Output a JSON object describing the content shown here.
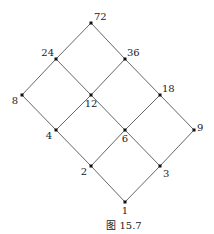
{
  "diagram": {
    "type": "hasse-diagram",
    "caption": "图 15.7",
    "nodes": [
      {
        "id": "72",
        "label": "72",
        "x": 91,
        "y": 23,
        "lx": 94,
        "ly": 20,
        "anchor": "start"
      },
      {
        "id": "24",
        "label": "24",
        "x": 56,
        "y": 59,
        "lx": 54,
        "ly": 56,
        "anchor": "end"
      },
      {
        "id": "36",
        "label": "36",
        "x": 125,
        "y": 59,
        "lx": 127,
        "ly": 56,
        "anchor": "start"
      },
      {
        "id": "8",
        "label": "8",
        "x": 22,
        "y": 95,
        "lx": 18,
        "ly": 104,
        "anchor": "end"
      },
      {
        "id": "12",
        "label": "12",
        "x": 91,
        "y": 95,
        "lx": 91,
        "ly": 107,
        "anchor": "middle"
      },
      {
        "id": "18",
        "label": "18",
        "x": 160,
        "y": 95,
        "lx": 162,
        "ly": 92,
        "anchor": "start"
      },
      {
        "id": "4",
        "label": "4",
        "x": 56,
        "y": 130,
        "lx": 52,
        "ly": 139,
        "anchor": "end"
      },
      {
        "id": "6",
        "label": "6",
        "x": 125,
        "y": 130,
        "lx": 125,
        "ly": 142,
        "anchor": "middle"
      },
      {
        "id": "9",
        "label": "9",
        "x": 194,
        "y": 130,
        "lx": 197,
        "ly": 131,
        "anchor": "start"
      },
      {
        "id": "2",
        "label": "2",
        "x": 91,
        "y": 166,
        "lx": 87,
        "ly": 175,
        "anchor": "end"
      },
      {
        "id": "3",
        "label": "3",
        "x": 160,
        "y": 166,
        "lx": 163,
        "ly": 177,
        "anchor": "start"
      },
      {
        "id": "1",
        "label": "1",
        "x": 125,
        "y": 202,
        "lx": 125,
        "ly": 214,
        "anchor": "middle"
      }
    ],
    "edges": [
      [
        "72",
        "24"
      ],
      [
        "72",
        "36"
      ],
      [
        "24",
        "8"
      ],
      [
        "24",
        "12"
      ],
      [
        "36",
        "12"
      ],
      [
        "36",
        "18"
      ],
      [
        "8",
        "4"
      ],
      [
        "12",
        "4"
      ],
      [
        "12",
        "6"
      ],
      [
        "18",
        "6"
      ],
      [
        "18",
        "9"
      ],
      [
        "4",
        "2"
      ],
      [
        "6",
        "2"
      ],
      [
        "6",
        "3"
      ],
      [
        "9",
        "3"
      ],
      [
        "2",
        "1"
      ],
      [
        "3",
        "1"
      ]
    ]
  }
}
